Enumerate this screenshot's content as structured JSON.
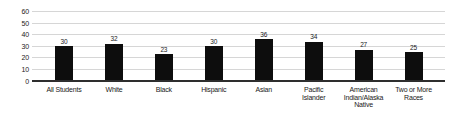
{
  "chart_data": {
    "type": "bar",
    "title": "",
    "xlabel": "",
    "ylabel": "",
    "categories": [
      "All Students",
      "White",
      "Black",
      "Hispanic",
      "Asian",
      "Pacific\nIslander",
      "American\nIndian/Alaska\nNative",
      "Two or More\nRaces"
    ],
    "values": [
      30,
      32,
      23,
      30,
      36,
      34,
      27,
      25
    ],
    "ylim": [
      0,
      60
    ],
    "yticks": [
      0,
      10,
      20,
      30,
      40,
      50,
      60
    ],
    "grid": true,
    "legend_position": "none",
    "bar_color": "#0d0d0d",
    "gridline_color": "#d6d6d6",
    "axis_line_color": "#2e2e2e",
    "text_color": "#1a1a1a",
    "background_color": "#ffffff"
  }
}
